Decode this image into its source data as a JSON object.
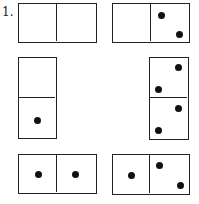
{
  "problem_label": "1.",
  "dominoes": [
    {
      "id": "top-left",
      "orientation": "horizontal",
      "values": [
        0,
        0
      ]
    },
    {
      "id": "top-right",
      "orientation": "horizontal",
      "values": [
        0,
        2
      ]
    },
    {
      "id": "middle-left",
      "orientation": "vertical",
      "values": [
        0,
        1
      ]
    },
    {
      "id": "middle-right",
      "orientation": "vertical",
      "values": [
        2,
        2
      ]
    },
    {
      "id": "bottom-left",
      "orientation": "horizontal",
      "values": [
        1,
        1
      ]
    },
    {
      "id": "bottom-right",
      "orientation": "horizontal",
      "values": [
        1,
        2
      ]
    }
  ],
  "colors": {
    "line": "#222222",
    "dot": "#111111",
    "background": "#ffffff"
  }
}
